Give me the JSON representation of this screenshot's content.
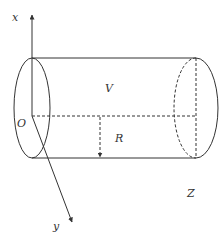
{
  "diagram": {
    "labels": {
      "x_axis": "x",
      "y_axis": "y",
      "z_axis": "Z",
      "origin": "O",
      "volume": "V",
      "radius": "R"
    },
    "colors": {
      "stroke": "#333333",
      "background": "#ffffff"
    }
  }
}
